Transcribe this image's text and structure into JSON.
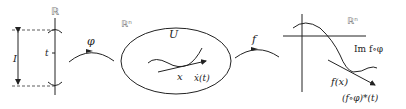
{
  "diagram": {
    "panel_line": {
      "space_label": "ℝ",
      "interval_label": "I",
      "point_label": "t"
    },
    "map_phi": {
      "label": "φ"
    },
    "panel_domain": {
      "space_label": "ℝⁿ",
      "region_label": "U",
      "point_label": "x",
      "tangent_label": "ẋ(t)"
    },
    "map_f": {
      "label": "f"
    },
    "panel_image": {
      "space_label": "ℝⁿ",
      "curve_label": "Im f∘φ",
      "point_label": "f(x)",
      "tangent_label": "(f∘φ)*(t)"
    }
  },
  "colors": {
    "ink": "#222222",
    "space_label": "#777777",
    "background": "#ffffff"
  }
}
